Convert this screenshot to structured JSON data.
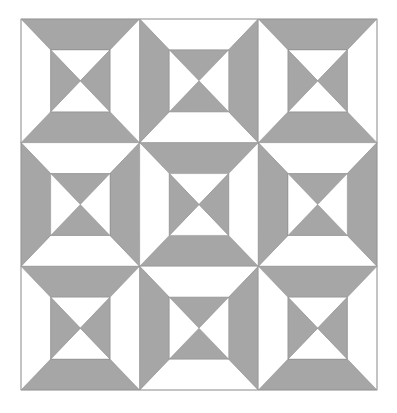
{
  "quilt": {
    "grid": {
      "x": 21,
      "y": 19,
      "width": 356,
      "height": 371,
      "rows": 3,
      "cols": 3
    },
    "inner_inset_ratio": 0.25,
    "colors": {
      "gray": "#a6a6a6",
      "white": "#ffffff",
      "line": "#8a8a8a"
    },
    "block_types": {
      "A": {
        "outer_top_bottom": "gray",
        "outer_left_right": "white",
        "inner_top_bottom": "white",
        "inner_left_right": "gray"
      },
      "B": {
        "outer_top_bottom": "white",
        "outer_left_right": "gray",
        "inner_top_bottom": "gray",
        "inner_left_right": "white"
      }
    },
    "layout": [
      [
        "A",
        "B",
        "A"
      ],
      [
        "B",
        "A",
        "B"
      ],
      [
        "A",
        "B",
        "A"
      ]
    ]
  }
}
